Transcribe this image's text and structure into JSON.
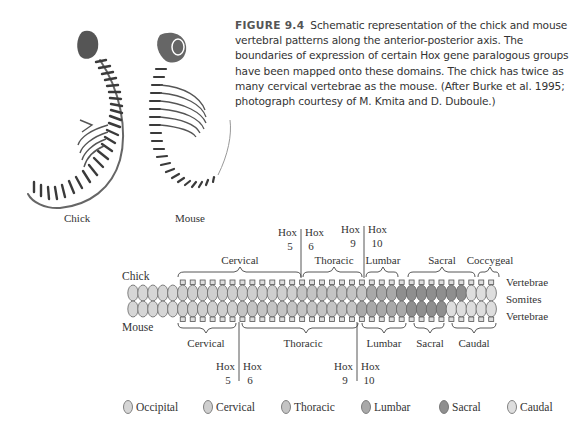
{
  "figure": {
    "number": "FIGURE 9.4",
    "caption": "Schematic representation of the chick and mouse vertebral patterns along the anterior-posterior axis. The boundaries of expression of certain Hox gene paralogous groups have been mapped onto these domains. The chick has twice as many cervical vertebrae as the mouse. (After Burke et al. 1995; photograph courtesy of M. Kmita and D. Duboule.)"
  },
  "photos": {
    "chick_label": "Chick",
    "mouse_label": "Mouse"
  },
  "diagram": {
    "row_labels": {
      "chick": "Chick",
      "mouse": "Mouse",
      "vertebrae_top": "Vertebrae",
      "somites": "Somites",
      "vertebrae_bottom": "Vertebrae"
    },
    "chick_regions": [
      "Cervical",
      "Thoracic",
      "Lumbar",
      "Sacral",
      "Coccygeal"
    ],
    "mouse_regions": [
      "Cervical",
      "Thoracic",
      "Lumbar",
      "Sacral",
      "Caudal"
    ],
    "chick_hox": [
      {
        "left": "Hox",
        "left_num": "5",
        "right": "Hox",
        "right_num": "6"
      },
      {
        "left": "Hox",
        "left_num": "9",
        "right": "Hox",
        "right_num": "10"
      }
    ],
    "mouse_hox": [
      {
        "left": "Hox",
        "left_num": "5",
        "right": "Hox",
        "right_num": "6"
      },
      {
        "left": "Hox",
        "left_num": "9",
        "right": "Hox",
        "right_num": "10"
      }
    ],
    "somite_colors": {
      "occipital": "#d6d6d6",
      "cervical": "#cfcfcf",
      "thoracic": "#c4c4c4",
      "lumbar": "#a9a9a9",
      "sacral": "#8f8f8f",
      "caudal": "#dedede"
    }
  },
  "legend": {
    "items": [
      {
        "label": "Occipital",
        "color": "#d6d6d6"
      },
      {
        "label": "Cervical",
        "color": "#cfcfcf"
      },
      {
        "label": "Thoracic",
        "color": "#c4c4c4"
      },
      {
        "label": "Lumbar",
        "color": "#a9a9a9"
      },
      {
        "label": "Sacral",
        "color": "#8f8f8f"
      },
      {
        "label": "Caudal",
        "color": "#dedede"
      }
    ]
  }
}
